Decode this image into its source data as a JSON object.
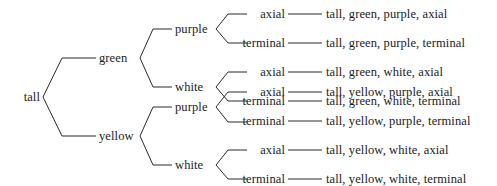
{
  "diagram": {
    "type": "forked-line-branch-diagram",
    "title_text": "",
    "line_color": "#2b2b2b",
    "text_color": "#1c1c1c",
    "background_color": "#ffffff",
    "root": {
      "label": "tall"
    },
    "level1": [
      {
        "label": "green"
      },
      {
        "label": "yellow"
      }
    ],
    "level2": [
      {
        "label": "purple"
      },
      {
        "label": "white"
      },
      {
        "label": "purple"
      },
      {
        "label": "white"
      }
    ],
    "level3": [
      {
        "label": "axial"
      },
      {
        "label": "terminal"
      },
      {
        "label": "axial"
      },
      {
        "label": "terminal"
      },
      {
        "label": "axial"
      },
      {
        "label": "terminal"
      },
      {
        "label": "axial"
      },
      {
        "label": "terminal"
      }
    ],
    "outcomes": [
      {
        "label": "tall, green, purple, axial"
      },
      {
        "label": "tall, green, purple, terminal"
      },
      {
        "label": "tall, green, white, axial"
      },
      {
        "label": "tall, green, white, terminal"
      },
      {
        "label": "tall, yellow, purple, axial"
      },
      {
        "label": "tall, yellow, purple, terminal"
      },
      {
        "label": "tall, yellow, white, axial"
      },
      {
        "label": "tall, yellow, white, terminal"
      }
    ]
  }
}
